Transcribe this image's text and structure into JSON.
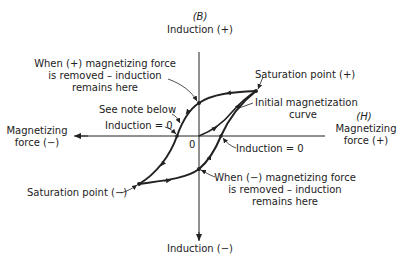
{
  "axes": {
    "vertical_symbol": "(B)",
    "vertical_top": "Induction (+)",
    "vertical_bottom": "Induction (−)",
    "horizontal_symbol": "(H)",
    "horizontal_right_line1": "Magnetizing",
    "horizontal_right_line2": "force (+)",
    "horizontal_left_line1": "Magnetizing",
    "horizontal_left_line2": "force (−)",
    "origin": "0"
  },
  "annotations": {
    "remanence_pos_line1": "When (+) magnetizing force",
    "remanence_pos_line2": "is removed – induction",
    "remanence_pos_line3": "remains here",
    "see_note": "See note below",
    "induction_zero_left": "Induction = 0",
    "saturation_pos": "Saturation point (+)",
    "initial_curve_line1": "Initial magnetization",
    "initial_curve_line2": "curve",
    "induction_zero_right": "Induction = 0",
    "saturation_neg": "Saturation point (−)",
    "remanence_neg_line1": "When (−) magnetizing force",
    "remanence_neg_line2": "is removed – induction",
    "remanence_neg_line3": "remains here"
  },
  "colors": {
    "ink": "#222222",
    "background": "#ffffff"
  }
}
